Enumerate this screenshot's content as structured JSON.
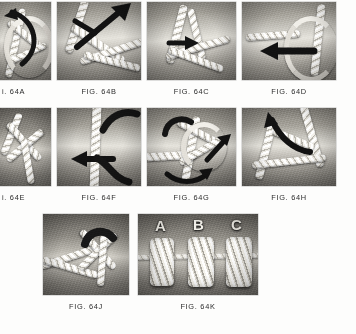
{
  "page": {
    "background_color": "#fdfdfc",
    "caption_color": "#2b2b2b",
    "panel_count": 10
  },
  "figures": [
    {
      "id": "64A",
      "caption": "i. 64A",
      "full_caption": "FIG. 64A",
      "clipped_left": true,
      "row": 1,
      "column": 1,
      "alt": "Grayscale photo: white rope strands crossed over a rope core, dark curved arrow at left"
    },
    {
      "id": "64B",
      "caption": "FIG. 64B",
      "full_caption": "FIG. 64B",
      "clipped_left": false,
      "row": 1,
      "column": 2,
      "alt": "Grayscale photo: white strand tucked under rope core, long dark straight arrow pointing up-right"
    },
    {
      "id": "64C",
      "caption": "FIG. 64C",
      "full_caption": "FIG. 64C",
      "clipped_left": false,
      "row": 1,
      "column": 3,
      "alt": "Grayscale photo: crossed white strands over rope, small dark arrow pointing right"
    },
    {
      "id": "64D",
      "caption": "FIG. 64D",
      "full_caption": "FIG. 64D",
      "clipped_left": false,
      "row": 1,
      "column": 4,
      "alt": "Grayscale photo: loop of white rope with thick dark arrow pointing left"
    },
    {
      "id": "64E",
      "caption": "i. 64E",
      "full_caption": "FIG. 64E",
      "clipped_left": true,
      "row": 2,
      "column": 1,
      "alt": "Grayscale photo: white strands crossing in an X over dark rope background"
    },
    {
      "id": "64F",
      "caption": "FIG. 64F",
      "full_caption": "FIG. 64F",
      "clipped_left": false,
      "row": 2,
      "column": 2,
      "alt": "Grayscale photo: vertical white rope with dark arrow pointing left"
    },
    {
      "id": "64G",
      "caption": "FIG. 64G",
      "full_caption": "FIG. 64G",
      "clipped_left": false,
      "row": 2,
      "column": 3,
      "alt": "Grayscale photo: knot forming on horizontal rope, dark arrows pointing up-right and curving below"
    },
    {
      "id": "64H",
      "caption": "FIG. 64H",
      "full_caption": "FIG. 64H",
      "clipped_left": false,
      "row": 2,
      "column": 4,
      "alt": "Grayscale photo: white strands over rope with dark arrow pointing up-left"
    },
    {
      "id": "64J",
      "caption": "FIG. 64J",
      "full_caption": "FIG. 64J",
      "clipped_left": false,
      "row": 3,
      "column": 1,
      "alt": "Grayscale photo: completed crossed-strand arrangement on rope"
    },
    {
      "id": "64K",
      "caption": "FIG. 64K",
      "full_caption": "FIG. 64K",
      "clipped_left": false,
      "row": 3,
      "column": 2,
      "alt": "Grayscale photo: three finished rope whippings labelled A, B and C",
      "specimen_labels": [
        "A",
        "B",
        "C"
      ]
    }
  ]
}
